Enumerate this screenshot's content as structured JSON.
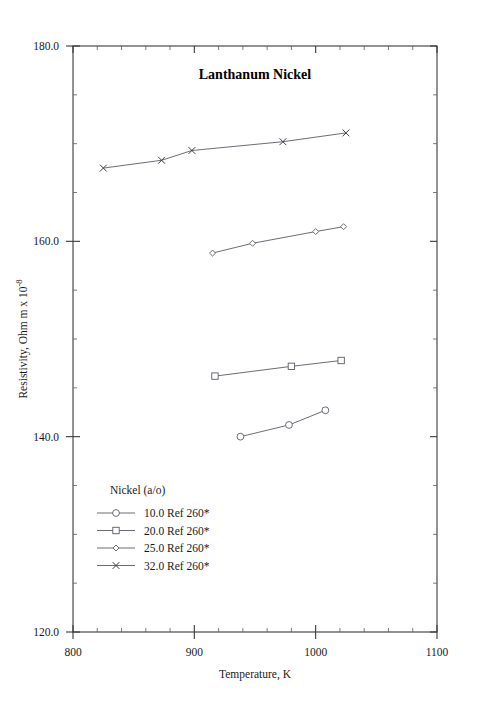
{
  "chart_data": {
    "type": "line",
    "title": "Lanthanum Nickel",
    "xlabel": "Temperature,  K",
    "ylabel": "Resistivity, Ohm m x 10",
    "ylabel_exponent": "-8",
    "xlim": [
      800,
      1100
    ],
    "ylim": [
      120.0,
      180.0
    ],
    "grid": false,
    "xticks": [
      800,
      900,
      1000,
      1100
    ],
    "xtick_labels": [
      "800",
      "900",
      "1000",
      "1100"
    ],
    "yticks": [
      120.0,
      140.0,
      160.0,
      180.0
    ],
    "ytick_labels": [
      "120.0",
      "140.0",
      "160.0",
      "180.0"
    ],
    "x_minor_step": 20,
    "y_minor_step": 5,
    "legend_position": "lower-left-inside",
    "legend_title": "Nickel (a/o)",
    "series": [
      {
        "name": "10.0 Ref 260*",
        "composition": "10.0",
        "reference": "Ref 260*",
        "marker": "circle",
        "x": [
          938,
          978,
          1008
        ],
        "y": [
          140.0,
          141.2,
          142.7
        ]
      },
      {
        "name": "20.0 Ref 260*",
        "composition": "20.0",
        "reference": "Ref 260*",
        "marker": "square",
        "x": [
          917,
          980,
          1021
        ],
        "y": [
          146.2,
          147.2,
          147.8
        ]
      },
      {
        "name": "25.0 Ref 260*",
        "composition": "25.0",
        "reference": "Ref 260*",
        "marker": "diamond",
        "x": [
          915,
          948,
          1000,
          1023
        ],
        "y": [
          158.8,
          159.8,
          161.0,
          161.5
        ]
      },
      {
        "name": "32.0 Ref 260*",
        "composition": "32.0",
        "reference": "Ref 260*",
        "marker": "cross",
        "x": [
          825,
          873,
          898,
          973,
          1025
        ],
        "y": [
          167.5,
          168.3,
          169.3,
          170.2,
          171.1
        ]
      }
    ]
  },
  "colors": {
    "background": "#ffffff",
    "axis": "#3a3a3a",
    "series_line": "#5b5b66",
    "text": "#1a1a1a"
  }
}
